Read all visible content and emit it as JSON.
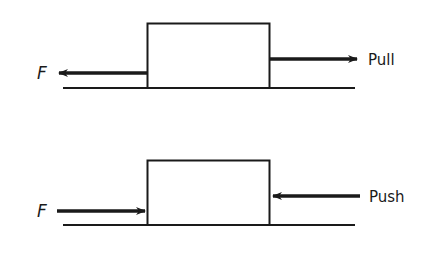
{
  "diagram": {
    "colors": {
      "stroke": "#1a1a1a",
      "background": "#ffffff"
    },
    "panels": [
      {
        "name": "pull",
        "force_label": "F",
        "action_label": "Pull",
        "force_direction": "left",
        "action_direction": "right"
      },
      {
        "name": "push",
        "force_label": "F",
        "action_label": "Push",
        "force_direction": "right",
        "action_direction": "left"
      }
    ]
  }
}
